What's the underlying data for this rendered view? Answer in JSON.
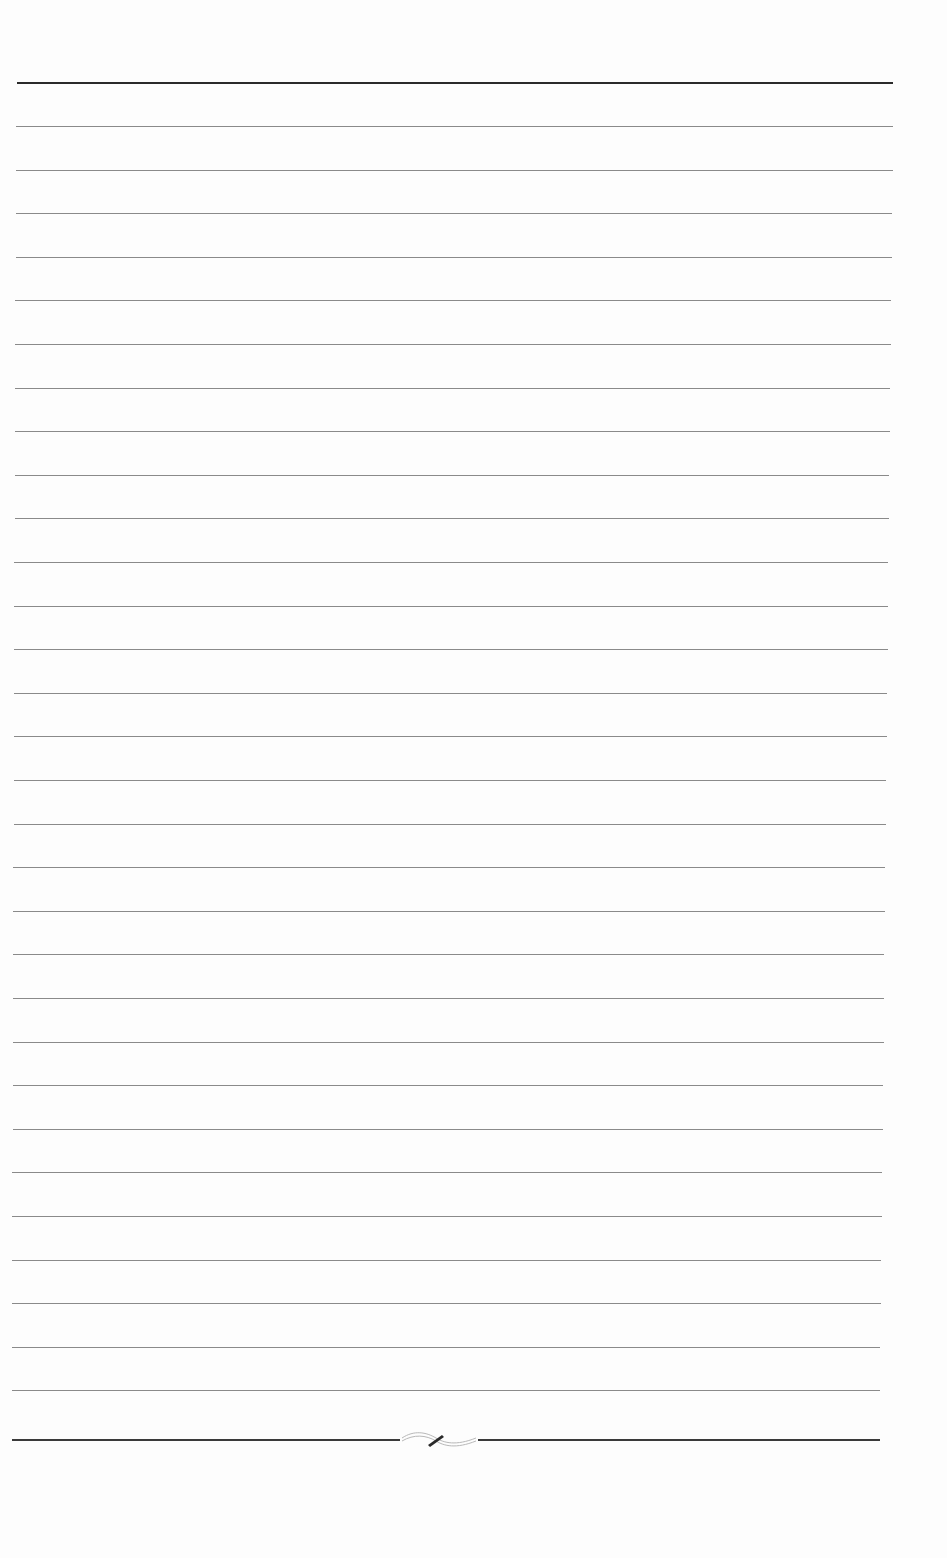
{
  "document": {
    "type": "ruled-sheet",
    "ruled_line_count": 30,
    "colors": {
      "paper": "#fdfdfd",
      "top_rule": "#2a2a2a",
      "ruled_line": "#8a8a8a",
      "bottom_rule": "#3a3a3a"
    },
    "ornament": "flourish-divider-icon"
  }
}
